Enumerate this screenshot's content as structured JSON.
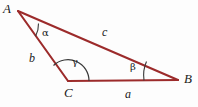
{
  "figure": {
    "type": "geometry-diagram",
    "background_color": "#fdfdfd",
    "line_color": "#9c2b2b",
    "arc_color": "#2b2b2b",
    "text_color": "#1a1a1a",
    "vertices": [
      {
        "name": "A",
        "label": "A",
        "x": 18,
        "y": 11,
        "label_x": 3,
        "label_y": 2
      },
      {
        "name": "B",
        "label": "B",
        "x": 178,
        "y": 80,
        "label_x": 184,
        "label_y": 72
      },
      {
        "name": "C",
        "label": "C",
        "x": 68,
        "y": 81,
        "label_x": 64,
        "label_y": 86
      }
    ],
    "sides": [
      {
        "name": "a",
        "label": "a",
        "from": "C",
        "to": "B",
        "label_x": 125,
        "label_y": 88
      },
      {
        "name": "b",
        "label": "b",
        "from": "A",
        "to": "C",
        "label_x": 29,
        "label_y": 52
      },
      {
        "name": "c",
        "label": "c",
        "from": "A",
        "to": "B",
        "label_x": 102,
        "label_y": 26
      }
    ],
    "angles": [
      {
        "name": "alpha",
        "label": "α",
        "at_vertex": "A",
        "label_x": 42,
        "label_y": 28
      },
      {
        "name": "beta",
        "label": "β",
        "at_vertex": "B",
        "label_x": 130,
        "label_y": 62
      },
      {
        "name": "gamma",
        "label": "γ",
        "at_vertex": "C",
        "label_x": 72,
        "label_y": 57
      }
    ]
  }
}
